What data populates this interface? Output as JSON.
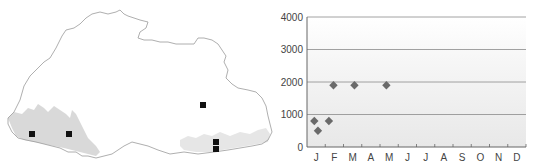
{
  "map": {
    "title": "Distribution map",
    "records": [
      {
        "id": "r1",
        "x": 32,
        "y": 134
      },
      {
        "id": "r2",
        "x": 69,
        "y": 134
      },
      {
        "id": "r3",
        "x": 203,
        "y": 105
      },
      {
        "id": "r4",
        "x": 216,
        "y": 142
      },
      {
        "id": "r5",
        "x": 216,
        "y": 149
      }
    ],
    "colors": {
      "border": "#9a9a9a",
      "shade": "#d9d9d9",
      "marker": "#111111"
    }
  },
  "chart_data": {
    "type": "scatter",
    "title": "",
    "xlabel": "",
    "ylabel": "",
    "categories": [
      "J",
      "F",
      "M",
      "A",
      "M",
      "J",
      "J",
      "A",
      "S",
      "O",
      "N",
      "D"
    ],
    "yticks": [
      0,
      1000,
      2000,
      3000,
      4000
    ],
    "ylim": [
      0,
      4000
    ],
    "grid": true,
    "legend": null,
    "series": [
      {
        "name": "Records",
        "marker": "diamond",
        "color": "#6a6a6a",
        "points": [
          {
            "month": 0.4,
            "value": 800
          },
          {
            "month": 0.6,
            "value": 500
          },
          {
            "month": 1.2,
            "value": 800
          },
          {
            "month": 1.45,
            "value": 1900
          },
          {
            "month": 2.6,
            "value": 1900
          },
          {
            "month": 4.35,
            "value": 1900
          }
        ]
      }
    ]
  }
}
